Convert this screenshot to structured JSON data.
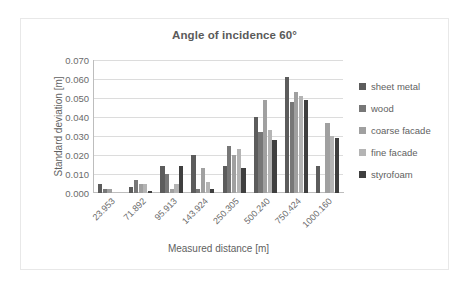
{
  "chart_data": {
    "type": "bar",
    "title": "Angle of incidence 60°",
    "xlabel": "Measured distance [m]",
    "ylabel": "Standard deviation [m]",
    "categories": [
      "23.953",
      "71.892",
      "95.913",
      "143.924",
      "250.305",
      "500.240",
      "750.424",
      "1000.160"
    ],
    "ylim": [
      0,
      0.07
    ],
    "yticks": [
      "0.000",
      "0.010",
      "0.020",
      "0.030",
      "0.040",
      "0.050",
      "0.060",
      "0.070"
    ],
    "ytick_values": [
      0.0,
      0.01,
      0.02,
      0.03,
      0.04,
      0.05,
      0.06,
      0.07
    ],
    "grid": true,
    "legend_position": "right",
    "series": [
      {
        "name": "sheet metal",
        "color": "#5c5c5c",
        "values": [
          0.005,
          0.003,
          0.014,
          0.02,
          0.014,
          0.04,
          0.061,
          0.014
        ]
      },
      {
        "name": "wood",
        "color": "#777777",
        "values": [
          0.002,
          0.007,
          0.01,
          0.002,
          0.025,
          0.032,
          0.048,
          0.0
        ]
      },
      {
        "name": "coarse facade",
        "color": "#a0a0a0",
        "values": [
          0.002,
          0.005,
          0.002,
          0.013,
          0.02,
          0.049,
          0.053,
          0.037
        ]
      },
      {
        "name": "fine facade",
        "color": "#b4b4b4",
        "values": [
          0.0,
          0.005,
          0.005,
          0.006,
          0.023,
          0.033,
          0.051,
          0.03
        ]
      },
      {
        "name": "styrofoam",
        "color": "#3f3f3f",
        "values": [
          0.0,
          0.001,
          0.014,
          0.002,
          0.013,
          0.028,
          0.049,
          0.029
        ]
      }
    ]
  }
}
